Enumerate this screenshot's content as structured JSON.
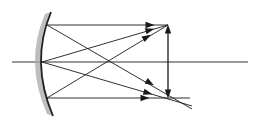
{
  "diagram": {
    "type": "optics-ray-diagram",
    "colors": {
      "background": "#ffffff",
      "line": "#1a1a1a",
      "mirror": "#222222",
      "mirror_shade": "#a8a8a8",
      "axis": "#333333"
    },
    "optical_axis": {
      "x1": 12,
      "y": 62,
      "x2": 248
    },
    "mirror": {
      "top": [
        51,
        12
      ],
      "bottom": [
        53,
        116
      ],
      "vertex": [
        41,
        62
      ]
    },
    "object_arrow": {
      "x": 168,
      "y_top": 25,
      "y_bottom": 98,
      "heads": "both"
    },
    "rays": [
      {
        "from": [
          47,
          25
        ],
        "to": [
          168,
          25
        ],
        "arrow_at": [
          150,
          25
        ]
      },
      {
        "from": [
          42,
          62
        ],
        "to": [
          168,
          25
        ],
        "arrow_at": [
          150,
          30
        ]
      },
      {
        "from": [
          47,
          98
        ],
        "to": [
          168,
          25
        ],
        "arrow_at": [
          147,
          37
        ]
      },
      {
        "from": [
          47,
          98
        ],
        "to": [
          190,
          98
        ],
        "arrow_at": [
          145,
          98
        ]
      },
      {
        "from": [
          42,
          62
        ],
        "to": [
          192,
          106
        ],
        "arrow_at": [
          148,
          93
        ]
      },
      {
        "from": [
          47,
          25
        ],
        "to": [
          192,
          109
        ],
        "arrow_at": [
          150,
          83
        ]
      }
    ]
  }
}
